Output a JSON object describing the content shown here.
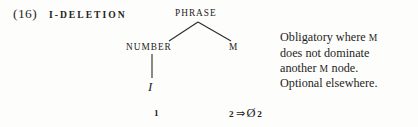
{
  "figure": {
    "example_number": "(16)",
    "rule_name": "I-DELETION",
    "tree": {
      "root": {
        "label": "PHRASE"
      },
      "children": [
        {
          "label": "NUMBER"
        },
        {
          "label": "M"
        }
      ],
      "terminal": "I"
    },
    "structural_analysis": {
      "index_1": "1",
      "index_2": "2",
      "operator": "⇒",
      "null_symbol": "Ø",
      "result_index": "2"
    },
    "condition_note": {
      "line1_a": "Obligatory where ",
      "line1_sc": "M",
      "line2": "does not dominate",
      "line3_a": "another ",
      "line3_sc": "M",
      "line3_b": " node.",
      "line4": "Optional elsewhere."
    }
  },
  "colors": {
    "ink": "#232321",
    "page": "#fdfdfc"
  }
}
